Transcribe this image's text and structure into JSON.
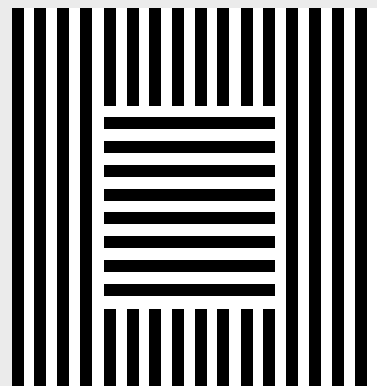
{
  "figure": {
    "title": "",
    "colors": {
      "background": "#ebebeb",
      "paper": "#ffffff",
      "stripe": "#000000"
    },
    "paper": {
      "x": 12,
      "y": 8,
      "w": 365,
      "h": 378
    },
    "vertical_stripes": {
      "x_positions": [
        12,
        34,
        57,
        80,
        104,
        127,
        149,
        172,
        195,
        217,
        241,
        263,
        286,
        309,
        332,
        355
      ],
      "width": 12,
      "top": 8,
      "bottom": 386
    },
    "central_square": {
      "x": 104,
      "y": 106,
      "w": 171,
      "h": 203,
      "stripe_columns_interrupted": [
        104,
        127,
        149,
        172,
        195,
        217,
        241,
        263
      ],
      "horizontal_bars": {
        "y_positions": [
          117,
          141,
          165,
          189,
          212,
          236,
          260,
          284
        ],
        "height": 12,
        "x": 104,
        "w": 171
      }
    }
  }
}
